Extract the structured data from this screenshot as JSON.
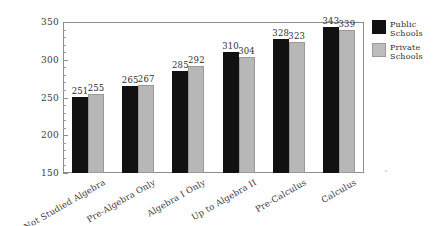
{
  "chart_data": {
    "type": "bar",
    "title": "",
    "subtitle": "",
    "xlabel": "",
    "ylabel": "",
    "ylim": [
      150,
      350
    ],
    "yticks": [
      150,
      200,
      250,
      300,
      350
    ],
    "ytick_labels": [
      "150",
      "200",
      "250",
      "300",
      "350"
    ],
    "minor_ticks": true,
    "grid": false,
    "legend_position": "right",
    "categories": [
      "Not Studied Algebra",
      "Pre-Algebra Only",
      "Algebra I Only",
      "Up to Algebra II",
      "Pre-Calculus",
      "Calculus"
    ],
    "series": [
      {
        "name": "Public Schools",
        "color": "#111111",
        "values": [
          251,
          265,
          285,
          310,
          328,
          343
        ]
      },
      {
        "name": "Private Schools",
        "color": "#b7b7b7",
        "values": [
          255,
          267,
          292,
          304,
          323,
          339
        ]
      }
    ]
  },
  "legend": {
    "items": [
      {
        "line1": "Public",
        "line2": "Schools",
        "swatch": "public"
      },
      {
        "line1": "Private",
        "line2": "Schools",
        "swatch": "private"
      }
    ]
  },
  "colors": {
    "public": "#111111",
    "private": "#b7b7b7",
    "axis": "#8d8d8d",
    "text": "#2e2e2e",
    "background": "#fefefe"
  }
}
